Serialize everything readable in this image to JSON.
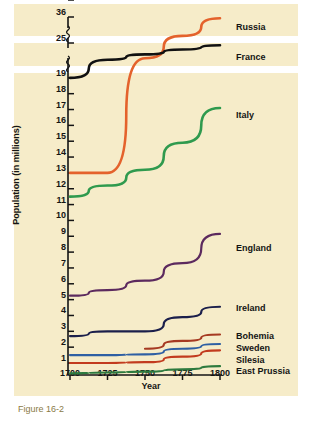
{
  "figure": {
    "background": "#f6ecc9",
    "caption": "Figure 16-2"
  },
  "axes": {
    "ylabel": "Population (in millions)",
    "xlabel": "Year",
    "yticks": [
      "36",
      "25",
      "20",
      "19",
      "18",
      "17",
      "16",
      "15",
      "14",
      "13",
      "12",
      "11",
      "10",
      "9",
      "8",
      "7",
      "6",
      "5",
      "4",
      "3",
      "2",
      "1"
    ],
    "xticks": [
      "1700",
      "1725",
      "1750",
      "1775",
      "1800"
    ],
    "axis_breaks": 2
  },
  "chart_data": {
    "type": "line",
    "title": "",
    "xlabel": "Year",
    "ylabel": "Population (in millions)",
    "xlim": [
      1700,
      1800
    ],
    "ylim": [
      0,
      36
    ],
    "grid": false,
    "legend": "right-inline-labels",
    "x": [
      1700,
      1725,
      1750,
      1775,
      1800
    ],
    "series": [
      {
        "name": "Russia",
        "color": "#e4622c",
        "values": [
          13.0,
          13.0,
          21.0,
          28.0,
          35.5
        ],
        "label_y": 22
      },
      {
        "name": "France",
        "color": "#111111",
        "values": [
          19.0,
          20.6,
          22.0,
          23.3,
          24.4
        ],
        "label_y": 52
      },
      {
        "name": "Italy",
        "color": "#2f9a4e",
        "values": [
          11.5,
          12.2,
          13.2,
          14.9,
          17.1
        ],
        "label_y": 110
      },
      {
        "name": "England",
        "color": "#5c2a5e",
        "values": [
          5.25,
          5.6,
          6.2,
          7.3,
          9.15
        ],
        "label_y": 243
      },
      {
        "name": "Ireland",
        "color": "#1b1f4b",
        "values": [
          2.7,
          3.0,
          3.0,
          3.9,
          4.55
        ],
        "label_y": 303
      },
      {
        "name": "Bohemia",
        "color": "#a63a22",
        "values": [
          null,
          null,
          1.9,
          2.4,
          2.8
        ],
        "label_y": 331
      },
      {
        "name": "Sweden",
        "color": "#2e5fa3",
        "values": [
          1.5,
          1.5,
          1.55,
          1.9,
          2.2
        ],
        "label_y": 343
      },
      {
        "name": "Silesia",
        "color": "#c23b1e",
        "values": [
          1.0,
          1.0,
          1.05,
          1.4,
          1.8
        ],
        "label_y": 355
      },
      {
        "name": "East Prussia",
        "color": "#2d7a3e",
        "values": [
          0.35,
          0.4,
          0.45,
          0.6,
          0.8
        ],
        "label_y": 366
      }
    ]
  }
}
